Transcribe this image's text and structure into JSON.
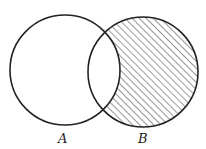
{
  "diagram": {
    "type": "venn",
    "sets": [
      {
        "label": "A",
        "shaded": false
      },
      {
        "label": "B",
        "shaded": true
      }
    ],
    "shaded_region": "B minus A",
    "hatch_color": "#333333",
    "stroke_color": "#222222"
  }
}
